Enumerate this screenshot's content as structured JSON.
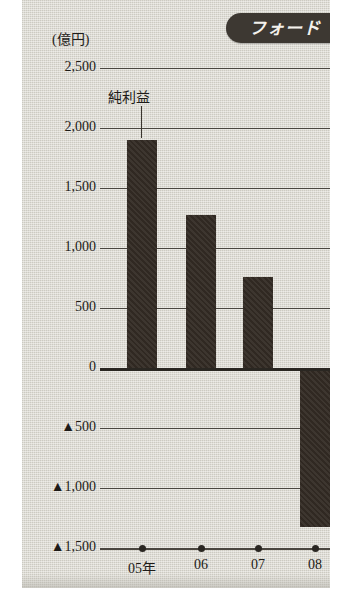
{
  "badge": {
    "label": "フォード"
  },
  "axis": {
    "unit_label": "(億円)",
    "y_ticks": [
      {
        "text": "2,500",
        "value": 2500
      },
      {
        "text": "2,000",
        "value": 2000
      },
      {
        "text": "1,500",
        "value": 1500
      },
      {
        "text": "1,000",
        "value": 1000
      },
      {
        "text": "500",
        "value": 500
      },
      {
        "text": "0",
        "value": 0
      },
      {
        "text": "▲500",
        "value": -500
      },
      {
        "text": "▲1,000",
        "value": -1000
      },
      {
        "text": "▲1,500",
        "value": -1500
      }
    ],
    "x_labels": [
      "05年",
      "06",
      "07",
      "08"
    ]
  },
  "annotation": {
    "label": "純利益"
  },
  "colors": {
    "panel_background": "#dedcd4",
    "bar": "#332b24",
    "badge": "#3d3832",
    "badge_text": "#f3f1ec",
    "axis_line": "#4a463f",
    "zero_line": "#2a2722",
    "text": "#1d1b18"
  },
  "chart_data": {
    "type": "bar",
    "title": "フォード",
    "xlabel": "",
    "ylabel": "(億円)",
    "categories": [
      "05年",
      "06",
      "07",
      "08"
    ],
    "values": [
      1900,
      1275,
      755,
      -1325
    ],
    "series": [
      {
        "name": "純利益",
        "values": [
          1900,
          1275,
          755,
          -1325
        ]
      }
    ],
    "ylim": [
      -1500,
      2500
    ],
    "ytick_values": [
      2500,
      2000,
      1500,
      1000,
      500,
      0,
      -500,
      -1000,
      -1500
    ],
    "ytick_labels": [
      "2,500",
      "2,000",
      "1,500",
      "1,000",
      "500",
      "0",
      "▲500",
      "▲1,000",
      "▲1,500"
    ],
    "grid": true,
    "legend": false,
    "annotations": [
      {
        "text": "純利益",
        "points_to_category": "05年"
      }
    ]
  }
}
